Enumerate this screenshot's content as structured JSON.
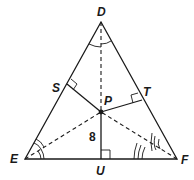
{
  "diagram": {
    "type": "triangle-incenter",
    "triangle": "DEF",
    "points": {
      "D": {
        "label": "D",
        "x": 101,
        "y": 22
      },
      "E": {
        "label": "E",
        "x": 25,
        "y": 159
      },
      "F": {
        "label": "F",
        "x": 177,
        "y": 159
      },
      "P": {
        "label": "P",
        "x": 101,
        "y": 112
      },
      "S": {
        "label": "S",
        "x": 67,
        "y": 84
      },
      "T": {
        "label": "T",
        "x": 142,
        "y": 100
      },
      "U": {
        "label": "U",
        "x": 101,
        "y": 159
      }
    },
    "segments": {
      "solid": [
        "DE",
        "DF",
        "EF",
        "PS",
        "PT",
        "PU"
      ],
      "dashed": [
        "DP",
        "EP",
        "FP"
      ]
    },
    "right_angles": [
      "S",
      "T",
      "U"
    ],
    "angle_marks": {
      "D": "single arc (bisected)",
      "E": "double arc (bisected)",
      "F": "triple arc (bisected)"
    },
    "measure_label": "8",
    "colors": {
      "line": "#1a1a1a",
      "background": "#ffffff"
    }
  }
}
